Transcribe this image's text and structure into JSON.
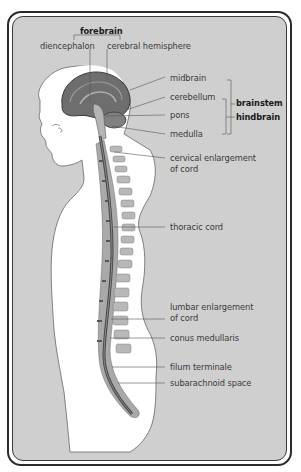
{
  "figure": {
    "background_color": "#cfcfcf",
    "frame_color": "#2b2b2b",
    "body_color": "#ffffff",
    "brain_color": "#6e6e6e",
    "vertebra_color": "#a9a9a9",
    "cord_color": "#5a5a5a"
  },
  "labels": {
    "forebrain": "forebrain",
    "diencephalon": "diencephalon",
    "cerebral_hemisphere": "cerebral hemisphere",
    "midbrain": "midbrain",
    "cerebellum": "cerebellum",
    "pons": "pons",
    "medulla": "medulla",
    "brainstem": "brainstem",
    "hindbrain": "hindbrain",
    "cervical_line1": "cervical enlargement",
    "cervical_line2": "of cord",
    "thoracic": "thoracic cord",
    "lumbar_line1": "lumbar enlargement",
    "lumbar_line2": "of cord",
    "conus": "conus medullaris",
    "filum": "filum terminale",
    "subarachnoid": "subarachnoid space"
  }
}
